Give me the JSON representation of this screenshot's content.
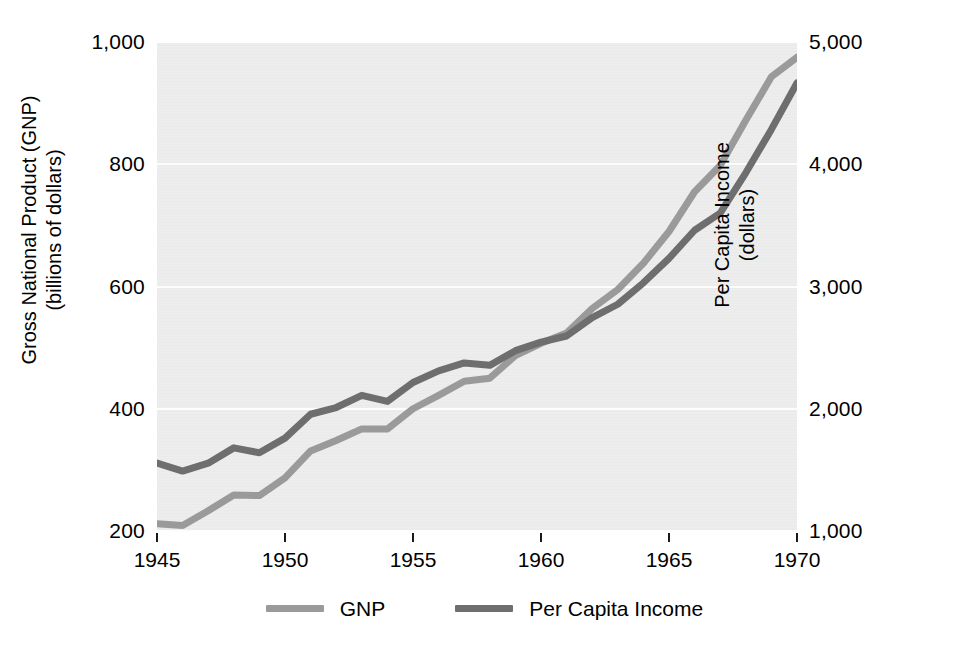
{
  "chart_data": {
    "type": "line",
    "title": "",
    "xlabel": "",
    "ylabel": "Gross National Product (GNP) (billions of dollars)",
    "y2label": "Per Capita Income (dollars)",
    "grid": true,
    "legend_position": "bottom-center",
    "xlim": [
      1945,
      1970
    ],
    "ylim": [
      200,
      1000
    ],
    "y2lim": [
      1000,
      5000
    ],
    "x": [
      1945,
      1946,
      1947,
      1948,
      1949,
      1950,
      1951,
      1952,
      1953,
      1954,
      1955,
      1956,
      1957,
      1958,
      1959,
      1960,
      1961,
      1962,
      1963,
      1964,
      1965,
      1966,
      1967,
      1968,
      1969,
      1970
    ],
    "series": [
      {
        "name": "GNP",
        "axis": "left",
        "units": "billions of dollars",
        "color": "#9a9a9a",
        "values": [
          212,
          209,
          233,
          259,
          258,
          287,
          331,
          348,
          367,
          367,
          400,
          422,
          445,
          450,
          487,
          507,
          524,
          564,
          595,
          638,
          690,
          755,
          798,
          872,
          943,
          975
        ]
      },
      {
        "name": "Per Capita Income",
        "axis": "right",
        "units": "dollars",
        "color": "#6e6e6e",
        "values": [
          1555,
          1490,
          1555,
          1680,
          1640,
          1760,
          1955,
          2010,
          2110,
          2060,
          2215,
          2310,
          2375,
          2355,
          2475,
          2545,
          2595,
          2745,
          2855,
          3030,
          3230,
          3460,
          3600,
          3930,
          4285,
          4665
        ]
      }
    ],
    "left_axis": {
      "ticks": [
        200,
        400,
        600,
        800,
        1000
      ],
      "tick_labels": [
        "200",
        "400",
        "600",
        "800",
        "1,000"
      ]
    },
    "right_axis": {
      "ticks": [
        1000,
        2000,
        3000,
        4000,
        5000
      ],
      "tick_labels": [
        "1,000",
        "2,000",
        "3,000",
        "4,000",
        "5,000"
      ]
    },
    "x_axis": {
      "ticks": [
        1945,
        1950,
        1955,
        1960,
        1965,
        1970
      ],
      "tick_labels": [
        "1945",
        "1950",
        "1955",
        "1960",
        "1965",
        "1970"
      ]
    },
    "legend": [
      {
        "label": "GNP",
        "color": "#9a9a9a"
      },
      {
        "label": "Per Capita Income",
        "color": "#6e6e6e"
      }
    ]
  }
}
